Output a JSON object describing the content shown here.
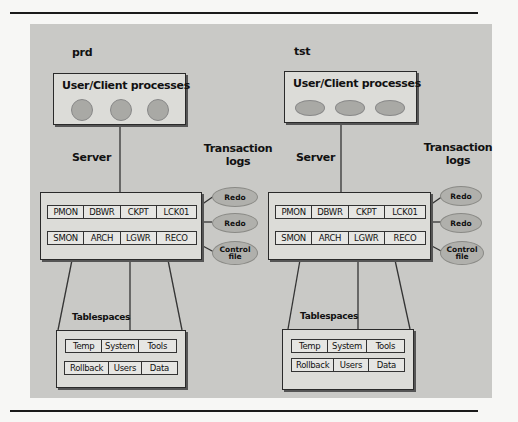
{
  "figure": {
    "systems": [
      {
        "name": "prd",
        "client_box_title": "User/Client processes",
        "client_process_count": 3,
        "server_label": "Server",
        "transaction_logs_label": "Transaction\nlogs",
        "background_processes": [
          [
            "PMON",
            "DBWR",
            "CKPT",
            "LCK01"
          ],
          [
            "SMON",
            "ARCH",
            "LGWR",
            "RECO"
          ]
        ],
        "log_files": [
          "Redo",
          "Redo",
          "Control file"
        ],
        "tablespaces_label": "Tablespaces",
        "tablespaces": [
          [
            "Temp",
            "System",
            "Tools"
          ],
          [
            "Rollback",
            "Users",
            "Data"
          ]
        ]
      },
      {
        "name": "tst",
        "client_box_title": "User/Client processes",
        "client_process_count": 3,
        "server_label": "Server",
        "transaction_logs_label": "Transaction\nlogs",
        "background_processes": [
          [
            "PMON",
            "DBWR",
            "CKPT",
            "LCK01"
          ],
          [
            "SMON",
            "ARCH",
            "LGWR",
            "RECO"
          ]
        ],
        "log_files": [
          "Redo",
          "Redo",
          "Control file"
        ],
        "tablespaces_label": "Tablespaces",
        "tablespaces": [
          [
            "Temp",
            "System",
            "Tools"
          ],
          [
            "Rollback",
            "Users",
            "Data"
          ]
        ]
      }
    ]
  }
}
